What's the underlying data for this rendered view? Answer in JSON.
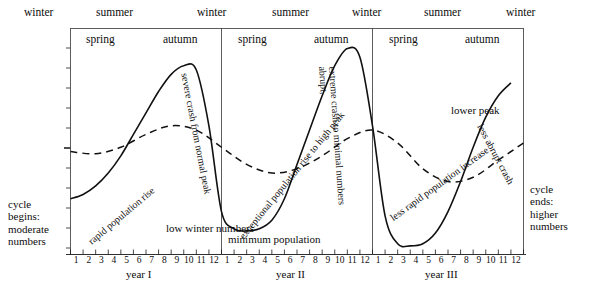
{
  "figure": {
    "type": "line",
    "title": "",
    "axis": {
      "x_label_years": [
        "year I",
        "year II",
        "year III"
      ],
      "months": [
        "1",
        "2",
        "3",
        "4",
        "5",
        "6",
        "7",
        "8",
        "9",
        "10",
        "11",
        "12"
      ],
      "y_ticks_unlabeled": 11,
      "grid": false
    },
    "seasons_outer": [
      "winter",
      "summer",
      "winter",
      "summer",
      "winter",
      "summer",
      "winter"
    ],
    "seasons_inner": [
      "spring",
      "autumn",
      "spring",
      "autumn",
      "spring",
      "autumn"
    ],
    "annotations": {
      "cycle_begins": "cycle\nbegins:\nmoderate\nnumbers",
      "cycle_ends": "cycle\nends:\nhigher\nnumbers",
      "rapid_rise": "rapid population rise",
      "severe_crash": "severe crash from normal peak",
      "low_winter": "low winter numbers",
      "exceptional_rise": "exceptional population rise to high peak",
      "abrupt_crash_l1": "abrupt,",
      "abrupt_crash_l2": "extreme crash to minimal numbers",
      "minimum_population": "minimum population",
      "less_rapid_increase": "less rapid population increase",
      "lower_peak": "lower peak",
      "less_abrupt_crash": "less abrupt crash"
    },
    "series": [
      {
        "name": "population (solid)",
        "style": "solid",
        "color": "#111111",
        "x": [
          0,
          3,
          6,
          9,
          12,
          15,
          18,
          21,
          24,
          27,
          30,
          33,
          36,
          39,
          42,
          45,
          48,
          51,
          54,
          57,
          60,
          63,
          66,
          69,
          72,
          75,
          78,
          81,
          84,
          87,
          90,
          93,
          96,
          99,
          102,
          105
        ],
        "y": [
          26,
          28,
          32,
          38,
          46,
          56,
          66,
          76,
          84,
          88,
          86,
          60,
          20,
          12,
          11,
          12,
          16,
          26,
          42,
          58,
          74,
          88,
          96,
          92,
          60,
          18,
          5,
          4,
          5,
          10,
          20,
          34,
          50,
          64,
          74,
          80
        ]
      },
      {
        "name": "reference cycle (dashed)",
        "style": "dashed",
        "color": "#111111",
        "x": [
          0,
          6,
          12,
          18,
          24,
          30,
          36,
          42,
          48,
          54,
          60,
          66,
          72,
          78,
          84,
          90,
          96,
          102,
          108
        ],
        "y": [
          48,
          47,
          50,
          56,
          60,
          58,
          50,
          42,
          38,
          40,
          46,
          54,
          58,
          52,
          40,
          34,
          36,
          44,
          52
        ]
      }
    ],
    "peaks": {
      "year_I": "normal peak",
      "year_II": "high peak",
      "year_III": "lower peak"
    }
  }
}
